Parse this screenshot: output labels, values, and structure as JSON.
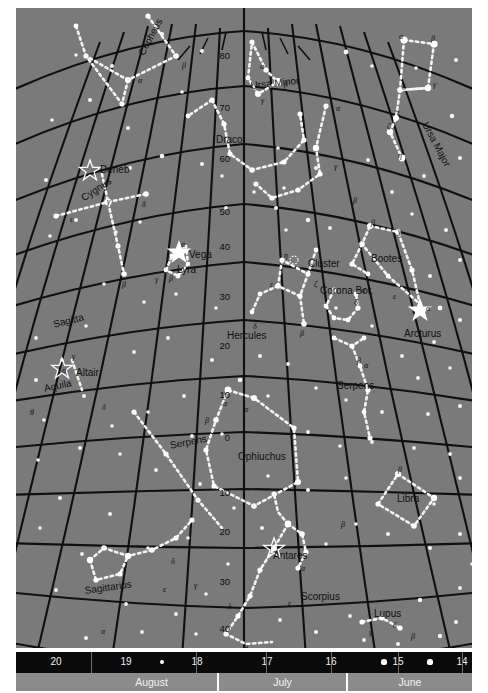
{
  "chart_data": {
    "type": "scatter",
    "xlabel": "Date of observation",
    "ylabel": "Declination (degrees)",
    "grid": true,
    "projection": "curved equatorial grid",
    "declination_ticks": [
      {
        "label": "80",
        "y": 47
      },
      {
        "label": "70",
        "y": 99
      },
      {
        "label": "60",
        "y": 150
      },
      {
        "label": "50",
        "y": 203
      },
      {
        "label": "40",
        "y": 238
      },
      {
        "label": "30",
        "y": 288
      },
      {
        "label": "20",
        "y": 337
      },
      {
        "label": "10",
        "y": 386
      },
      {
        "label": "0",
        "y": 429
      },
      {
        "label": "10",
        "y": 484
      },
      {
        "label": "20",
        "y": 523
      },
      {
        "label": "30",
        "y": 573
      },
      {
        "label": "40",
        "y": 620
      }
    ],
    "constellations": [
      {
        "name": "Cepheus",
        "x": 120,
        "y": 44,
        "rotate": -62
      },
      {
        "name": "Ursa Minor",
        "x": 234,
        "y": 72,
        "rotate": -6
      },
      {
        "name": "Ursa Major",
        "x": 414,
        "y": 112,
        "rotate": 62
      },
      {
        "name": "Draco",
        "x": 200,
        "y": 126,
        "rotate": 0
      },
      {
        "name": "Cygnus",
        "x": 63,
        "y": 186,
        "rotate": -34
      },
      {
        "name": "Lyra",
        "x": 161,
        "y": 256,
        "rotate": 0
      },
      {
        "name": "Bootes",
        "x": 355,
        "y": 245,
        "rotate": 0
      },
      {
        "name": "Corona Bor.",
        "x": 304,
        "y": 277,
        "rotate": 0
      },
      {
        "name": "Cluster",
        "x": 292,
        "y": 250,
        "rotate": 0
      },
      {
        "name": "Hercules",
        "x": 211,
        "y": 322,
        "rotate": 0
      },
      {
        "name": "Sagitta",
        "x": 36,
        "y": 311,
        "rotate": -14
      },
      {
        "name": "Aquila",
        "x": 27,
        "y": 375,
        "rotate": -12
      },
      {
        "name": "Serpens",
        "x": 321,
        "y": 372,
        "rotate": 0
      },
      {
        "name": "Serpens",
        "x": 153,
        "y": 432,
        "rotate": -11
      },
      {
        "name": "Ophiuchus",
        "x": 222,
        "y": 443,
        "rotate": 0
      },
      {
        "name": "Libra",
        "x": 381,
        "y": 485,
        "rotate": 0
      },
      {
        "name": "Scorpius",
        "x": 285,
        "y": 583,
        "rotate": 0
      },
      {
        "name": "Sagittarius",
        "x": 68,
        "y": 577,
        "rotate": -8
      },
      {
        "name": "Lupus",
        "x": 358,
        "y": 600,
        "rotate": 0
      }
    ],
    "named_stars": [
      {
        "name": "Deneb",
        "x": 84,
        "y": 156,
        "symbol": "open-star"
      },
      {
        "name": "Vega",
        "x": 173,
        "y": 241,
        "symbol": "filled-star"
      },
      {
        "name": "Altair",
        "x": 60,
        "y": 359,
        "symbol": "open-star"
      },
      {
        "name": "Arcturus",
        "x": 388,
        "y": 320,
        "symbol": "filled-star"
      },
      {
        "name": "Antares",
        "x": 257,
        "y": 542,
        "symbol": "open-star"
      }
    ],
    "greek_labels": [
      {
        "g": "β",
        "x": 166,
        "y": 53
      },
      {
        "g": "α",
        "x": 122,
        "y": 68
      },
      {
        "g": "α",
        "x": 244,
        "y": 54
      },
      {
        "g": "β",
        "x": 268,
        "y": 72
      },
      {
        "g": "γ",
        "x": 245,
        "y": 88
      },
      {
        "g": "α",
        "x": 383,
        "y": 24
      },
      {
        "g": "β",
        "x": 415,
        "y": 26
      },
      {
        "g": "γ",
        "x": 417,
        "y": 72
      },
      {
        "g": "δ",
        "x": 386,
        "y": 75
      },
      {
        "g": "ε",
        "x": 381,
        "y": 100
      },
      {
        "g": "ζ",
        "x": 371,
        "y": 114
      },
      {
        "g": "η",
        "x": 382,
        "y": 143
      },
      {
        "g": "α",
        "x": 320,
        "y": 96
      },
      {
        "g": "γ",
        "x": 318,
        "y": 154
      },
      {
        "g": "β",
        "x": 337,
        "y": 188
      },
      {
        "g": "α",
        "x": 87,
        "y": 172
      },
      {
        "g": "γ",
        "x": 91,
        "y": 189
      },
      {
        "g": "δ",
        "x": 126,
        "y": 192
      },
      {
        "g": "ε",
        "x": 54,
        "y": 207
      },
      {
        "g": "β",
        "x": 106,
        "y": 272
      },
      {
        "g": "α",
        "x": 165,
        "y": 232
      },
      {
        "g": "γ",
        "x": 139,
        "y": 267
      },
      {
        "g": "β",
        "x": 153,
        "y": 266
      },
      {
        "g": "β",
        "x": 355,
        "y": 210
      },
      {
        "g": "γ",
        "x": 382,
        "y": 219
      },
      {
        "g": "ε",
        "x": 377,
        "y": 284
      },
      {
        "g": "α",
        "x": 410,
        "y": 296
      },
      {
        "g": "η",
        "x": 268,
        "y": 243
      },
      {
        "g": "ζ",
        "x": 298,
        "y": 272
      },
      {
        "g": "ε",
        "x": 254,
        "y": 272
      },
      {
        "g": "α",
        "x": 345,
        "y": 278
      },
      {
        "g": "δ",
        "x": 338,
        "y": 290
      },
      {
        "g": "β",
        "x": 284,
        "y": 321
      },
      {
        "g": "δ",
        "x": 237,
        "y": 314
      },
      {
        "g": "β",
        "x": 341,
        "y": 348
      },
      {
        "g": "α",
        "x": 348,
        "y": 353
      },
      {
        "g": "γ",
        "x": 56,
        "y": 344
      },
      {
        "g": "α",
        "x": 46,
        "y": 358
      },
      {
        "g": "δ",
        "x": 86,
        "y": 395
      },
      {
        "g": "θ",
        "x": 14,
        "y": 400
      },
      {
        "g": "α",
        "x": 207,
        "y": 391
      },
      {
        "g": "α",
        "x": 228,
        "y": 397
      },
      {
        "g": "β",
        "x": 189,
        "y": 408
      },
      {
        "g": "β",
        "x": 382,
        "y": 457
      },
      {
        "g": "β",
        "x": 325,
        "y": 512
      },
      {
        "g": "α",
        "x": 285,
        "y": 556
      },
      {
        "g": "ε",
        "x": 272,
        "y": 591
      },
      {
        "g": "λ",
        "x": 212,
        "y": 594
      },
      {
        "g": "θ",
        "x": 228,
        "y": 636
      },
      {
        "g": "δ",
        "x": 155,
        "y": 549
      },
      {
        "g": "γ",
        "x": 178,
        "y": 573
      },
      {
        "g": "ε",
        "x": 147,
        "y": 577
      },
      {
        "g": "α",
        "x": 85,
        "y": 619
      },
      {
        "g": "δ",
        "x": 377,
        "y": 613
      },
      {
        "g": "γ",
        "x": 353,
        "y": 620
      },
      {
        "g": "β",
        "x": 395,
        "y": 624
      }
    ]
  },
  "date_scale": {
    "numbers": [
      {
        "label": "20",
        "x": 40
      },
      {
        "label": "19",
        "x": 110
      },
      {
        "label": "18",
        "x": 181
      },
      {
        "label": "17",
        "x": 251
      },
      {
        "label": "16",
        "x": 315
      },
      {
        "label": "15",
        "x": 382
      },
      {
        "label": "14",
        "x": 446
      }
    ],
    "months": [
      {
        "label": "August",
        "x": 70,
        "w": 131
      },
      {
        "label": "July",
        "x": 203,
        "w": 127
      },
      {
        "label": "June",
        "x": 332,
        "w": 124
      }
    ]
  }
}
